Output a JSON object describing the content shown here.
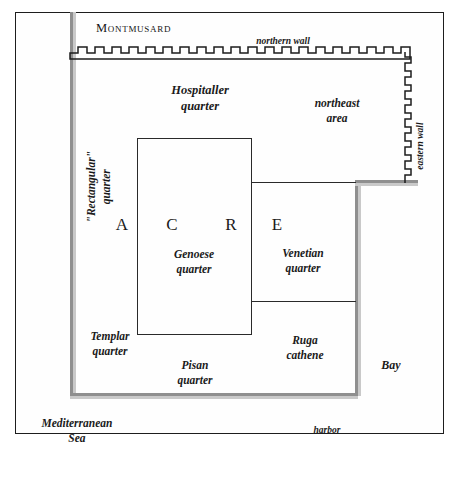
{
  "map": {
    "title": "Acre",
    "region_label": "Montmusard",
    "walls": {
      "northern": "northern wall",
      "eastern": "eastern wall"
    },
    "city_name_letters": [
      "A",
      "C",
      "R",
      "E"
    ],
    "quarters": [
      {
        "name": "hospitaller",
        "line1": "Hospitaller",
        "line2": "quarter"
      },
      {
        "name": "rectangular",
        "line1": "\"Rectangular\"",
        "line2": "quarter"
      },
      {
        "name": "genoese",
        "line1": "Genoese",
        "line2": "quarter"
      },
      {
        "name": "venetian",
        "line1": "Venetian",
        "line2": "quarter"
      },
      {
        "name": "templar",
        "line1": "Templar",
        "line2": "quarter"
      },
      {
        "name": "pisan",
        "line1": "Pisan",
        "line2": "quarter"
      },
      {
        "name": "ruga-cathene",
        "line1": "Ruga",
        "line2": "cathene"
      }
    ],
    "areas": {
      "northeast_line1": "northeast",
      "northeast_line2": "area"
    },
    "water": {
      "sea_line1": "Mediterranean",
      "sea_line2": "Sea",
      "bay": "Bay",
      "harbor": "harbor"
    },
    "colors": {
      "frame_stroke": "#1d1d1d",
      "wall_stroke": "#1d1d1d",
      "city_edge": "#8f8f8f",
      "city_edge_shadow": "#c9c9c9",
      "divider": "#2a2a2a",
      "text": "#1a1a1a",
      "background": "#ffffff"
    }
  }
}
